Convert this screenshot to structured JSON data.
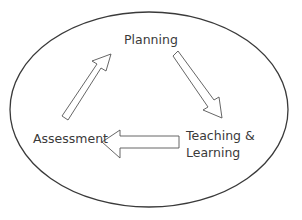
{
  "diagram": {
    "type": "cycle",
    "nodes": [
      {
        "id": "planning",
        "label": "Planning"
      },
      {
        "id": "teaching",
        "label_line1": "Teaching &",
        "label_line2": "Learning"
      },
      {
        "id": "assessment",
        "label": "Assessment"
      }
    ],
    "edges": [
      {
        "from": "planning",
        "to": "teaching"
      },
      {
        "from": "teaching",
        "to": "assessment"
      },
      {
        "from": "assessment",
        "to": "planning"
      }
    ],
    "colors": {
      "stroke": "#3a3a3a",
      "text": "#3a3a3a",
      "background": "#ffffff"
    }
  }
}
